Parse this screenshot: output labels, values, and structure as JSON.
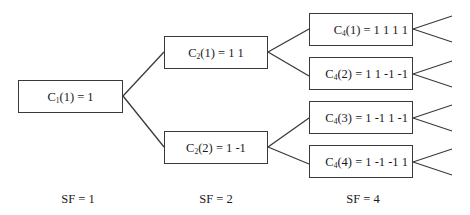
{
  "diagram": {
    "type": "ovsf-code-tree",
    "nodes": [
      {
        "id": "c1-1",
        "sym": "C",
        "sub": "1",
        "idx": "(1)",
        "code": " = 1"
      },
      {
        "id": "c2-1",
        "sym": "C",
        "sub": "2",
        "idx": "(1)",
        "code": " = 1 1"
      },
      {
        "id": "c2-2",
        "sym": "C",
        "sub": "2",
        "idx": "(2)",
        "code": " = 1 -1"
      },
      {
        "id": "c4-1",
        "sym": "C",
        "sub": "4",
        "idx": "(1)",
        "code": " = 1 1 1 1"
      },
      {
        "id": "c4-2",
        "sym": "C",
        "sub": "4",
        "idx": "(2)",
        "code": " = 1 1 -1 -1"
      },
      {
        "id": "c4-3",
        "sym": "C",
        "sub": "4",
        "idx": "(3)",
        "code": " = 1 -1 1 -1"
      },
      {
        "id": "c4-4",
        "sym": "C",
        "sub": "4",
        "idx": "(4)",
        "code": " = 1 -1 -1 1"
      }
    ],
    "edges": [
      [
        "c1-1",
        "c2-1"
      ],
      [
        "c1-1",
        "c2-2"
      ],
      [
        "c2-1",
        "c4-1"
      ],
      [
        "c2-1",
        "c4-2"
      ],
      [
        "c2-2",
        "c4-3"
      ],
      [
        "c2-2",
        "c4-4"
      ]
    ],
    "levels": [
      {
        "label": "SF = 1"
      },
      {
        "label": "SF = 2"
      },
      {
        "label": "SF = 4"
      }
    ],
    "line_color": "#3a3a3a"
  }
}
